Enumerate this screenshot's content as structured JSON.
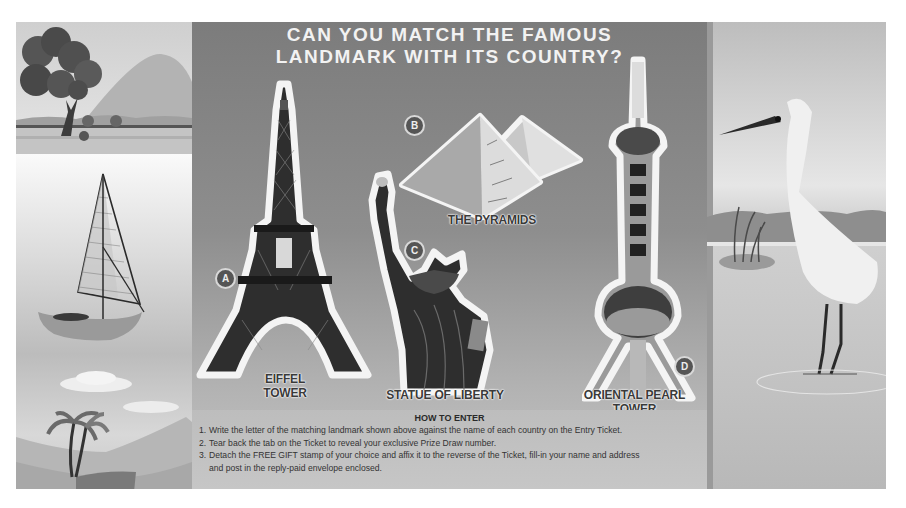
{
  "title": {
    "line1": "CAN YOU MATCH THE FAMOUS",
    "line2": "LANDMARK WITH ITS COUNTRY?"
  },
  "landmarks": [
    {
      "letter": "A",
      "name_line1": "EIFFEL",
      "name_line2": "TOWER",
      "icon": "eiffel-tower-icon"
    },
    {
      "letter": "B",
      "name": "THE PYRAMIDS",
      "icon": "pyramids-icon"
    },
    {
      "letter": "C",
      "name": "STATUE OF LIBERTY",
      "icon": "statue-of-liberty-icon"
    },
    {
      "letter": "D",
      "name": "ORIENTAL PEARL TOWER",
      "icon": "oriental-pearl-tower-icon"
    }
  ],
  "how_to_enter": {
    "heading": "HOW TO ENTER",
    "steps": [
      {
        "num": "1.",
        "text": "Write the letter of the matching landmark shown above against the name of each country on the Entry Ticket."
      },
      {
        "num": "2.",
        "text": "Tear back the tab on the Ticket to reveal your exclusive Prize Draw number."
      },
      {
        "num": "3.",
        "text": "Detach the FREE GIFT stamp of your choice and affix it to the reverse of the Ticket, fill-in your name and address",
        "continuation": "and post in the reply-paid envelope enclosed."
      }
    ]
  },
  "decorations": {
    "left_panel": [
      "tree-and-mountain-illustration",
      "sailboat-illustration",
      "palm-tree-beach-illustration"
    ],
    "right_panel": [
      "heron-illustration"
    ]
  },
  "colors": {
    "panel_top": "#7c7c7c",
    "panel_bottom": "#c4c4c4",
    "badge": "#555555",
    "title_text": "#f2f2f2"
  }
}
